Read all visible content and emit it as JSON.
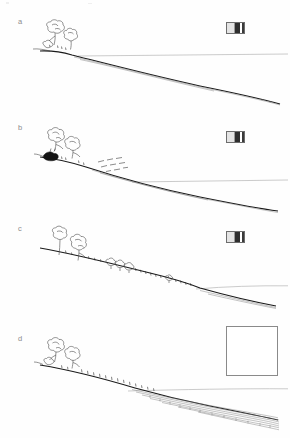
{
  "figure": {
    "type": "scientific-line-drawing",
    "panel_count": 4,
    "background_color": "#ffffff",
    "line_color": "#1a1a1a",
    "horizon_color": "#b4b4b4"
  },
  "panels": [
    {
      "label": "a",
      "label_x": 18,
      "label_y": 24,
      "stage_name": "vegetated-slope-intact",
      "icon": {
        "name": "scale-icon",
        "type": "striped-square",
        "x": 226,
        "y": 22,
        "width": 19,
        "height": 12
      },
      "features": [
        "tree-cluster",
        "slope-profile",
        "horizon-line"
      ]
    },
    {
      "label": "b",
      "label_x": 18,
      "label_y": 123,
      "stage_name": "initial-disturbance",
      "icon": {
        "name": "scale-icon",
        "type": "striped-square",
        "x": 226,
        "y": 131,
        "width": 19,
        "height": 12
      },
      "features": [
        "tree-cluster",
        "dark-patch",
        "dashed-marks",
        "slope-profile",
        "horizon-line"
      ]
    },
    {
      "label": "c",
      "label_x": 18,
      "label_y": 228,
      "stage_name": "shrub-colonisation",
      "icon": {
        "name": "scale-icon",
        "type": "striped-square",
        "x": 226,
        "y": 231,
        "width": 19,
        "height": 12
      },
      "features": [
        "tall-trees",
        "shrub-clusters",
        "grass-tufts",
        "slope-profile",
        "horizon-line"
      ]
    },
    {
      "label": "d",
      "label_x": 18,
      "label_y": 339,
      "stage_name": "deposition-stage",
      "icon": {
        "name": "empty-box",
        "type": "empty-square",
        "x": 226,
        "y": 326,
        "width": 52,
        "height": 50
      },
      "features": [
        "tree-cluster",
        "grass-tufts",
        "stippled-deposit",
        "slope-profile",
        "horizon-line"
      ]
    }
  ],
  "colors": {
    "ink": "#1a1a1a",
    "vegetation": "#4a4a4a",
    "horizon": "#b4b4b4",
    "label": "#8d8d8d",
    "dark_mass": "#141414",
    "stipple": "#7a7a7a"
  }
}
